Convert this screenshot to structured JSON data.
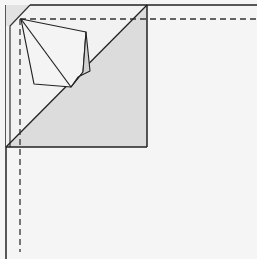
{
  "diagram": {
    "type": "origami-fold-step",
    "colors": {
      "background": "#f5f5f5",
      "paper_white": "#f3f3f3",
      "paper_shaded": "#d9d9d9",
      "paper_light": "#e8e8e8",
      "line": "#222222",
      "dash": "#333333"
    },
    "elements": [
      {
        "name": "sheet-outline",
        "kind": "solid-edges"
      },
      {
        "name": "folded-corner-square",
        "kind": "square"
      },
      {
        "name": "diagonal-fold-triangle",
        "kind": "shaded-triangle"
      },
      {
        "name": "inner-kite-flap",
        "kind": "polygon"
      },
      {
        "name": "valley-fold-line-horizontal",
        "kind": "dashed-line"
      },
      {
        "name": "valley-fold-line-vertical",
        "kind": "dashed-line"
      }
    ]
  }
}
